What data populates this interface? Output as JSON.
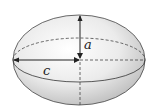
{
  "diagram": {
    "type": "ellipsoid",
    "labels": {
      "a": "a",
      "c": "c"
    },
    "colors": {
      "outline": "#333333",
      "shade_light": "#ffffff",
      "shade_dark": "#bdbdbd",
      "dashed": "#444444",
      "arrow": "#222222"
    }
  }
}
